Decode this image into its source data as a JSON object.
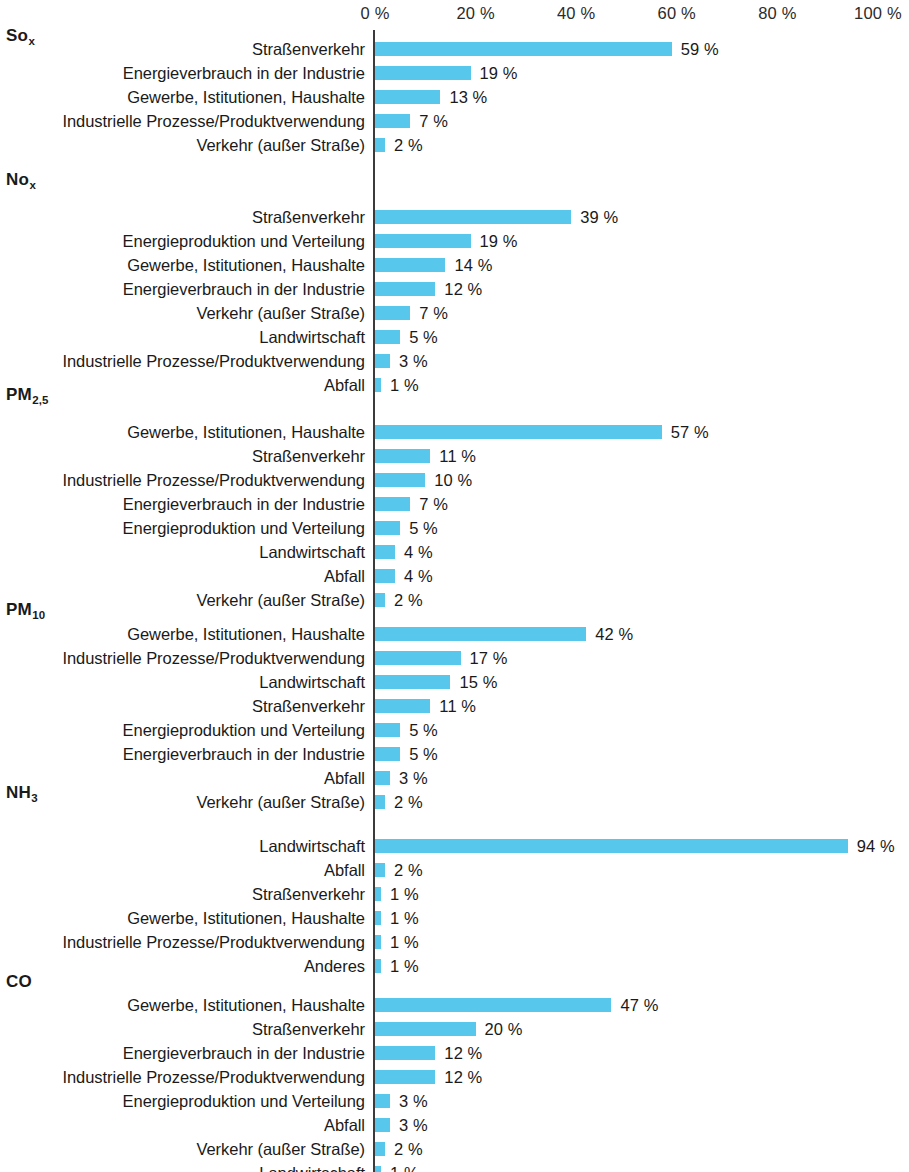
{
  "chart_data": {
    "type": "bar",
    "title": "",
    "subtitle": "",
    "xlabel": "",
    "ylabel": "",
    "orientation": "horizontal",
    "xlim": [
      0,
      100
    ],
    "grid": false,
    "legend": null,
    "unit": "%",
    "axis": {
      "ticks": [
        {
          "value": 0,
          "label": "0 %"
        },
        {
          "value": 20,
          "label": "20 %"
        },
        {
          "value": 40,
          "label": "40 %"
        },
        {
          "value": 60,
          "label": "60 %"
        },
        {
          "value": 80,
          "label": "80 %"
        },
        {
          "value": 100,
          "label": "100 %"
        }
      ]
    },
    "bar_color": "#57c7ec",
    "panels": [
      {
        "id": "sox",
        "title_main": "So",
        "title_sub": "x",
        "categories": [
          "Straßenverkehr",
          "Energieverbrauch in der Industrie",
          "Gewerbe, Istitutionen, Haushalte",
          "Industrielle Prozesse/Produktverwendung",
          "Verkehr (außer Straße)"
        ],
        "values": [
          59,
          19,
          13,
          7,
          2
        ],
        "value_labels": [
          "59 %",
          "19 %",
          "13 %",
          "7 %",
          "2 %"
        ]
      },
      {
        "id": "nox",
        "title_main": "No",
        "title_sub": "x",
        "categories": [
          "Straßenverkehr",
          "Energieproduktion und Verteilung",
          "Gewerbe, Istitutionen, Haushalte",
          "Energieverbrauch in der Industrie",
          "Verkehr (außer Straße)",
          "Landwirtschaft",
          "Industrielle Prozesse/Produktverwendung",
          "Abfall"
        ],
        "values": [
          39,
          19,
          14,
          12,
          7,
          5,
          3,
          1
        ],
        "value_labels": [
          "39 %",
          "19 %",
          "14 %",
          "12 %",
          "7 %",
          "5 %",
          "3 %",
          "1 %"
        ]
      },
      {
        "id": "pm25",
        "title_main": "PM",
        "title_sub": "2,5",
        "categories": [
          "Gewerbe, Istitutionen, Haushalte",
          "Straßenverkehr",
          "Industrielle Prozesse/Produktverwendung",
          "Energieverbrauch in der Industrie",
          "Energieproduktion und Verteilung",
          "Landwirtschaft",
          "Abfall",
          "Verkehr (außer Straße)"
        ],
        "values": [
          57,
          11,
          10,
          7,
          5,
          4,
          4,
          2
        ],
        "value_labels": [
          "57 %",
          "11 %",
          "10 %",
          "7 %",
          "5 %",
          "4 %",
          "4 %",
          "2 %"
        ]
      },
      {
        "id": "pm10",
        "title_main": "PM",
        "title_sub": "10",
        "categories": [
          "Gewerbe, Istitutionen, Haushalte",
          "Industrielle Prozesse/Produktverwendung",
          "Landwirtschaft",
          "Straßenverkehr",
          "Energieproduktion und Verteilung",
          "Energieverbrauch in der Industrie",
          "Abfall",
          "Verkehr (außer Straße)"
        ],
        "values": [
          42,
          17,
          15,
          11,
          5,
          5,
          3,
          2
        ],
        "value_labels": [
          "42 %",
          "17 %",
          "15 %",
          "11 %",
          "5 %",
          "5 %",
          "3 %",
          "2 %"
        ]
      },
      {
        "id": "nh3",
        "title_main": "NH",
        "title_sub": "3",
        "categories": [
          "Landwirtschaft",
          "Abfall",
          "Straßenverkehr",
          "Gewerbe, Istitutionen, Haushalte",
          "Industrielle Prozesse/Produktverwendung",
          "Anderes"
        ],
        "values": [
          94,
          2,
          1,
          1,
          1,
          1
        ],
        "value_labels": [
          "94 %",
          "2 %",
          "1 %",
          "1 %",
          "1 %",
          "1 %"
        ]
      },
      {
        "id": "co",
        "title_main": "CO",
        "title_sub": "",
        "categories": [
          "Gewerbe, Istitutionen, Haushalte",
          "Straßenverkehr",
          "Energieverbrauch in der Industrie",
          "Industrielle Prozesse/Produktverwendung",
          "Energieproduktion und Verteilung",
          "Abfall",
          "Verkehr (außer Straße)",
          "Landwirtschaft"
        ],
        "values": [
          47,
          20,
          12,
          12,
          3,
          3,
          2,
          1
        ],
        "value_labels": [
          "47 %",
          "20 %",
          "12 %",
          "12 %",
          "3 %",
          "3 %",
          "2 %",
          "1 %"
        ]
      }
    ]
  },
  "layout": {
    "panel_title_tops": [
      26,
      170,
      385,
      600,
      783,
      972
    ],
    "panel_rows_tops": [
      40,
      208,
      423,
      625,
      837,
      996
    ]
  }
}
